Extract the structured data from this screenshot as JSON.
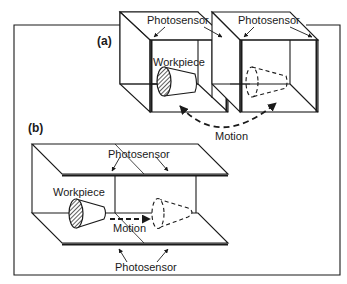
{
  "figure": {
    "panel_a": {
      "tag": "(a)",
      "sensor_label_1": "Photosensor",
      "sensor_label_2": "Photosensor",
      "workpiece_label": "Workpiece",
      "motion_label": "Motion"
    },
    "panel_b": {
      "tag": "(b)",
      "sensor_label_top": "Photosensor",
      "sensor_label_bottom": "Photosensor",
      "workpiece_label": "Workpiece",
      "motion_label": "Motion"
    },
    "colors": {
      "line": "#1a1a1a",
      "background": "#ffffff"
    }
  }
}
